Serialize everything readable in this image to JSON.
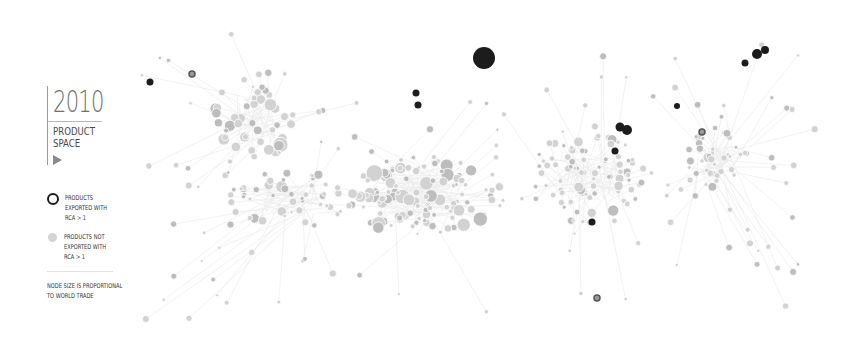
{
  "panel": {
    "year": "2010",
    "title_line1": "PRODUCT",
    "title_line2": "SPACE",
    "play_icon": "play-triangle-icon"
  },
  "legend": {
    "rca_line1": "PRODUCTS",
    "rca_line2": "EXPORTED WITH",
    "rca_line3": "RCA > 1",
    "non_line1": "PRODUCTS NOT",
    "non_line2": "EXPORTED WITH",
    "non_line3": "RCA > 1",
    "note_line1": "NODE SIZE IS PROPORTIONAL",
    "note_line2": "TO WORLD TRADE"
  },
  "colors": {
    "rca_node": "#1c1c1c",
    "rca_node_mid": "#555555",
    "non_node": "#d2d2d2",
    "non_node_dark": "#bdbdbd",
    "edge": "#ececec",
    "text": "#333333",
    "year": "#6e6e6e"
  },
  "graph": {
    "_provenance": "observed_rca_nodes are read off the screenshot. clusters and filler_nodes are approximate layout from the overall visual reading. edges are generated procedurally, not traced from the image.",
    "observed_rca_nodes": [
      {
        "x": 484,
        "y": 58,
        "r": 11
      },
      {
        "x": 150,
        "y": 82,
        "r": 3.5
      },
      {
        "x": 192,
        "y": 74,
        "r": 3,
        "ring": true
      },
      {
        "x": 416,
        "y": 93,
        "r": 3.5
      },
      {
        "x": 418,
        "y": 105,
        "r": 3.5
      },
      {
        "x": 620,
        "y": 127,
        "r": 4.5
      },
      {
        "x": 627,
        "y": 130,
        "r": 5
      },
      {
        "x": 615,
        "y": 151,
        "r": 3.5
      },
      {
        "x": 677,
        "y": 106,
        "r": 3
      },
      {
        "x": 592,
        "y": 222,
        "r": 3.5
      },
      {
        "x": 745,
        "y": 63,
        "r": 3.5
      },
      {
        "x": 757,
        "y": 54,
        "r": 5
      },
      {
        "x": 765,
        "y": 50,
        "r": 4
      },
      {
        "x": 702,
        "y": 132,
        "r": 3,
        "ring": true
      },
      {
        "x": 597,
        "y": 298,
        "r": 3,
        "ring": true
      }
    ],
    "clusters": [
      {
        "cx": 255,
        "cy": 115,
        "rx": 40,
        "ry": 45,
        "n": 40,
        "rmin": 3,
        "rmax": 8
      },
      {
        "cx": 420,
        "cy": 195,
        "rx": 85,
        "ry": 40,
        "n": 110,
        "rmin": 2,
        "rmax": 9
      },
      {
        "cx": 590,
        "cy": 180,
        "rx": 60,
        "ry": 45,
        "n": 70,
        "rmin": 2,
        "rmax": 6
      },
      {
        "cx": 715,
        "cy": 160,
        "rx": 35,
        "ry": 30,
        "n": 35,
        "rmin": 2,
        "rmax": 7
      },
      {
        "cx": 290,
        "cy": 200,
        "rx": 60,
        "ry": 30,
        "n": 40,
        "rmin": 2,
        "rmax": 6
      }
    ],
    "filler_nodes": 220,
    "seed": 20100
  }
}
